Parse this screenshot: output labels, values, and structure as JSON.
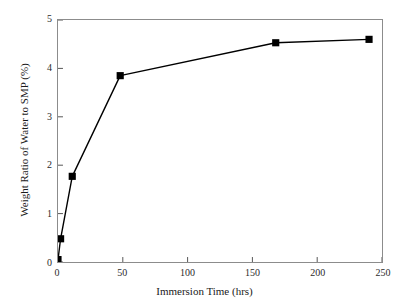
{
  "chart_data": {
    "type": "line",
    "title": "",
    "xlabel": "Immersion Time (hrs)",
    "ylabel": "Weight Ratio of Water to SMP (%)",
    "xlim": [
      0,
      250
    ],
    "ylim": [
      0,
      5
    ],
    "xticks": [
      0,
      50,
      100,
      150,
      200,
      250
    ],
    "yticks": [
      0,
      1,
      2,
      3,
      4,
      5
    ],
    "xtick_labels": [
      "0",
      "50",
      "100",
      "150",
      "200",
      "250"
    ],
    "ytick_labels": [
      "0",
      "1",
      "2",
      "3",
      "4",
      "5"
    ],
    "grid": false,
    "legend": false,
    "legend_position": "none",
    "series": [
      {
        "name": "Weight Ratio of Water to SMP",
        "marker": "filled-square",
        "marker_color": "#000000",
        "line_color": "#000000",
        "x": [
          0,
          2,
          11,
          48,
          168,
          240
        ],
        "values": [
          0.05,
          0.48,
          1.77,
          3.85,
          4.53,
          4.6
        ]
      }
    ]
  },
  "axes": {
    "x_title": "Immersion Time (hrs)",
    "y_title": "Weight Ratio of Water to SMP (%)",
    "frame_color": "#8c8c8c"
  },
  "colors": {
    "background": "#ffffff",
    "data": "#000000",
    "axis": "#555555",
    "text": "#1a1a1a"
  }
}
